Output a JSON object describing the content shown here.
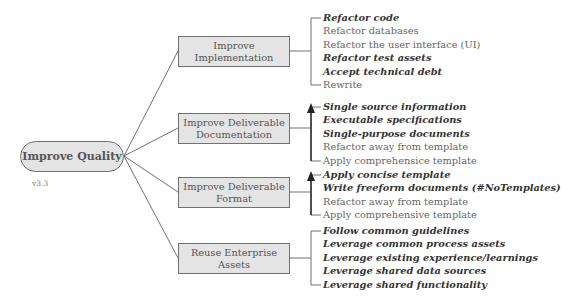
{
  "root": {
    "label": "Improve Quality",
    "version": "v3.3"
  },
  "branches": [
    {
      "title_lines": [
        "Improve",
        "Implementation"
      ],
      "connector": "bracket",
      "leaves": [
        {
          "label": "Refactor code",
          "emphasis": true
        },
        {
          "label": "Refactor databases",
          "emphasis": false
        },
        {
          "label": "Refactor the user interface (UI)",
          "emphasis": false
        },
        {
          "label": "Refactor test assets",
          "emphasis": true
        },
        {
          "label": "Accept technical debt",
          "emphasis": true
        },
        {
          "label": "Rewrite",
          "emphasis": false
        }
      ]
    },
    {
      "title_lines": [
        "Improve Deliverable",
        "Documentation"
      ],
      "connector": "arrow-up",
      "leaves": [
        {
          "label": "Single source information",
          "emphasis": true
        },
        {
          "label": "Executable specifications",
          "emphasis": true
        },
        {
          "label": "Single-purpose documents",
          "emphasis": true
        },
        {
          "label": "Refactor away from template",
          "emphasis": false
        },
        {
          "label": "Apply comprehensice template",
          "emphasis": false
        }
      ]
    },
    {
      "title_lines": [
        "Improve Deliverable",
        "Format"
      ],
      "connector": "arrow-up",
      "leaves": [
        {
          "label": "Apply concise template",
          "emphasis": true
        },
        {
          "label": "Write freeform documents (#NoTemplates)",
          "emphasis": true
        },
        {
          "label": "Refactor away from template",
          "emphasis": false
        },
        {
          "label": "Apply comprehensive template",
          "emphasis": false
        }
      ]
    },
    {
      "title_lines": [
        "Reuse Enterprise",
        "Assets"
      ],
      "connector": "bracket",
      "leaves": [
        {
          "label": "Follow common guidelines",
          "emphasis": true
        },
        {
          "label": "Leverage common process assets",
          "emphasis": true
        },
        {
          "label": "Leverage existing experience/learnings",
          "emphasis": true
        },
        {
          "label": "Leverage shared data sources",
          "emphasis": true
        },
        {
          "label": "Leverage shared functionality",
          "emphasis": true
        }
      ]
    }
  ],
  "colors": {
    "node_fill": "#e4e4e4",
    "node_border": "#707070",
    "line": "#707070",
    "arrow": "#222222",
    "text_regular": "#666666",
    "text_emphasis": "#333333"
  }
}
